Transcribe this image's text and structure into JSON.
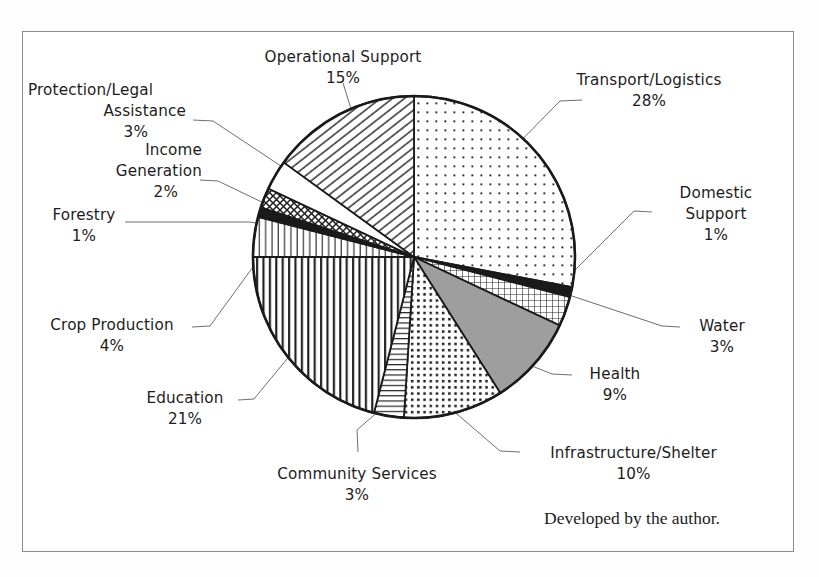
{
  "figure": {
    "credit": "Developed by the author.",
    "frame_color": "#8d8d8d"
  },
  "chart_data": {
    "type": "pie",
    "title": "",
    "subtitle": "",
    "xlabel": "",
    "ylabel": "",
    "legend_position": "callout-labels",
    "grid": false,
    "value_suffix": "%",
    "total": 100,
    "start_angle_deg": 0,
    "direction": "clockwise",
    "categories": [
      "Transport/Logistics",
      "Domestic Support",
      "Water",
      "Health",
      "Infrastructure/Shelter",
      "Community Services",
      "Education",
      "Crop Production",
      "Forestry",
      "Income Generation",
      "Protection/Legal Assistance",
      "Operational Support"
    ],
    "values": [
      28,
      1,
      3,
      9,
      10,
      3,
      21,
      4,
      1,
      2,
      3,
      15
    ],
    "slices": [
      {
        "label": "Transport/Logistics",
        "label_lines": [
          "Transport/Logistics"
        ],
        "value": 28,
        "value_text": "28%",
        "pattern": "sparse-dots",
        "fill": "#ffffff",
        "dot_color": "#2b2b2b",
        "start_deg": 0,
        "end_deg": 100.8
      },
      {
        "label": "Domestic Support",
        "label_lines": [
          "Domestic",
          "Support"
        ],
        "value": 1,
        "value_text": "1%",
        "pattern": "solid-black",
        "fill": "#1a1a1a",
        "start_deg": 100.8,
        "end_deg": 104.4
      },
      {
        "label": "Water",
        "label_lines": [
          "Water"
        ],
        "value": 3,
        "value_text": "3%",
        "pattern": "fine-grid",
        "fill": "#ffffff",
        "start_deg": 104.4,
        "end_deg": 115.2
      },
      {
        "label": "Health",
        "label_lines": [
          "Health"
        ],
        "value": 9,
        "value_text": "9%",
        "pattern": "solid-gray",
        "fill": "#9e9e9e",
        "start_deg": 115.2,
        "end_deg": 147.6
      },
      {
        "label": "Infrastructure/Shelter",
        "label_lines": [
          "Infrastructure/Shelter"
        ],
        "value": 10,
        "value_text": "10%",
        "pattern": "dense-dots",
        "fill": "#ffffff",
        "dot_color": "#1f1f1f",
        "start_deg": 147.6,
        "end_deg": 183.6
      },
      {
        "label": "Community Services",
        "label_lines": [
          "Community Services"
        ],
        "value": 3,
        "value_text": "3%",
        "pattern": "horizontal-lines",
        "fill": "#ffffff",
        "start_deg": 183.6,
        "end_deg": 194.4
      },
      {
        "label": "Education",
        "label_lines": [
          "Education"
        ],
        "value": 21,
        "value_text": "21%",
        "pattern": "vertical-lines-bold",
        "fill": "#ffffff",
        "start_deg": 194.4,
        "end_deg": 270
      },
      {
        "label": "Crop Production",
        "label_lines": [
          "Crop Production"
        ],
        "value": 4,
        "value_text": "4%",
        "pattern": "vertical-lines-thin",
        "fill": "#ffffff",
        "start_deg": 270,
        "end_deg": 284.4
      },
      {
        "label": "Forestry",
        "label_lines": [
          "Forestry"
        ],
        "value": 1,
        "value_text": "1%",
        "pattern": "solid-black",
        "fill": "#1a1a1a",
        "start_deg": 284.4,
        "end_deg": 288
      },
      {
        "label": "Income Generation",
        "label_lines": [
          "Income",
          "Generation"
        ],
        "value": 2,
        "value_text": "2%",
        "pattern": "crosshatch",
        "fill": "#ffffff",
        "start_deg": 288,
        "end_deg": 295.2
      },
      {
        "label": "Protection/Legal Assistance",
        "label_lines": [
          "Protection/Legal",
          "Assistance"
        ],
        "value": 3,
        "value_text": "3%",
        "pattern": "blank-white",
        "fill": "#ffffff",
        "start_deg": 295.2,
        "end_deg": 306
      },
      {
        "label": "Operational Support",
        "label_lines": [
          "Operational Support"
        ],
        "value": 15,
        "value_text": "15%",
        "pattern": "diagonal-hatch",
        "fill": "#ffffff",
        "start_deg": 306,
        "end_deg": 360
      }
    ]
  },
  "labels": {
    "operational_support": {
      "name": "Operational Support",
      "pct": "15%"
    },
    "transport_logistics": {
      "name": "Transport/Logistics",
      "pct": "28%"
    },
    "protection_legal_l1": "Protection/Legal",
    "protection_legal_l2": "Assistance",
    "protection_legal_pct": "3%",
    "income_generation_l1": "Income",
    "income_generation_l2": "Generation",
    "income_generation_pct": "2%",
    "forestry": {
      "name": "Forestry",
      "pct": "1%"
    },
    "crop_production": {
      "name": "Crop Production",
      "pct": "4%"
    },
    "education": {
      "name": "Education",
      "pct": "21%"
    },
    "community_services": {
      "name": "Community Services",
      "pct": "3%"
    },
    "infrastructure_shelter": {
      "name": "Infrastructure/Shelter",
      "pct": "10%"
    },
    "health": {
      "name": "Health",
      "pct": "9%"
    },
    "water": {
      "name": "Water",
      "pct": "3%"
    },
    "domestic_support_l1": "Domestic",
    "domestic_support_l2": "Support",
    "domestic_support_pct": "1%"
  }
}
